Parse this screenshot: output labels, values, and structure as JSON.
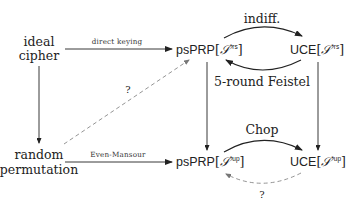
{
  "nodes": {
    "ideal_cipher": {
      "line1": "ideal",
      "line2": "cipher"
    },
    "random_permutation": {
      "line1": "random",
      "line2": "permutation"
    },
    "psprp_rs": {
      "name": "psPRP",
      "open": "[",
      "set": "𝒮",
      "sup": "*rs",
      "close": "]"
    },
    "uce_rs": {
      "name": "UCE",
      "open": "[",
      "set": "𝒮",
      "sup": "*rs",
      "close": "]"
    },
    "psprp_up": {
      "name": "psPRP",
      "open": "[",
      "set": "𝒮",
      "sup": "*up",
      "close": "]"
    },
    "uce_up": {
      "name": "UCE",
      "open": "[",
      "set": "𝒮",
      "sup": "*up",
      "close": "]"
    }
  },
  "edges": {
    "direct_keying": "direct keying",
    "even_mansour": "Even-Mansour",
    "indiff": "indiff.",
    "five_round_feistel": "5-round Feistel",
    "chop": "Chop",
    "question_diag": "?",
    "question_bottom": "?"
  }
}
